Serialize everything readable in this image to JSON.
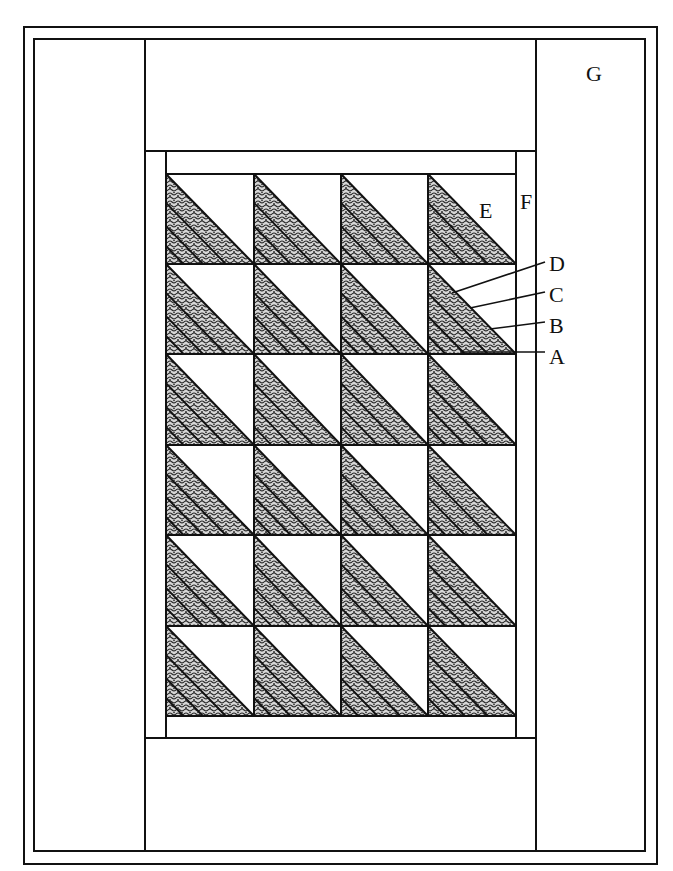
{
  "diagram": {
    "type": "quilt-layout",
    "grid": {
      "rows": 6,
      "cols": 4
    },
    "block": "half-square triangle, lower-left half divided into 4 diagonal strips",
    "labels": {
      "A": "A",
      "B": "B",
      "C": "C",
      "D": "D",
      "E": "E",
      "F": "F",
      "G": "G"
    },
    "label_meaning": {
      "A": "strip A (bottom-left strip of triangle)",
      "B": "strip B",
      "C": "strip C",
      "D": "strip D (strip along diagonal)",
      "E": "plain triangle",
      "F": "inner border",
      "G": "outer border"
    },
    "colors": {
      "line": "#111111",
      "background": "#ffffff",
      "fabric_dark": "#3a3a3a"
    }
  }
}
